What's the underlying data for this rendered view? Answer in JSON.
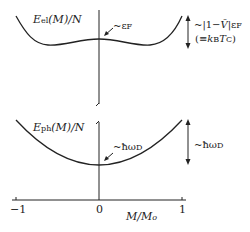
{
  "diagram": {
    "top_panel": {
      "curve_label": "E_el(M)/N",
      "curve_label_parts": {
        "main": "E",
        "sub": "el",
        "rest": "(M)/N"
      },
      "annotation_center": "~ε_F",
      "annotation_center_parts": {
        "prefix": "~ε",
        "sub": "F"
      },
      "depth_label_line1": "~|1−V̄|ε_F",
      "depth_label_line2": "(≡k_B T_C)",
      "depth_parts": {
        "l1a": "~|1−",
        "l1v": "V̄",
        "l1b": "|ε",
        "l1sub": "F",
        "l2a": "(≡",
        "l2k": "k",
        "l2ksub": "B",
        "l2t": "T",
        "l2tsub": "C",
        "l2b": ")"
      }
    },
    "bottom_panel": {
      "curve_label": "E_ph(M)/N",
      "curve_label_parts": {
        "main": "E",
        "sub": "ph",
        "rest": "(M)/N"
      },
      "annotation_center": "~ħω_D",
      "annotation_center_parts": {
        "prefix": "~ħω",
        "sub": "D"
      },
      "depth_label": "~ħω_D",
      "depth_parts": {
        "prefix": "~ħω",
        "sub": "D"
      }
    },
    "x_axis": {
      "label": "M/M₀",
      "label_parts": {
        "a": "M/M",
        "sub": "o"
      },
      "ticks": [
        "−1",
        "0",
        "1"
      ]
    },
    "line_color": "#222222"
  }
}
